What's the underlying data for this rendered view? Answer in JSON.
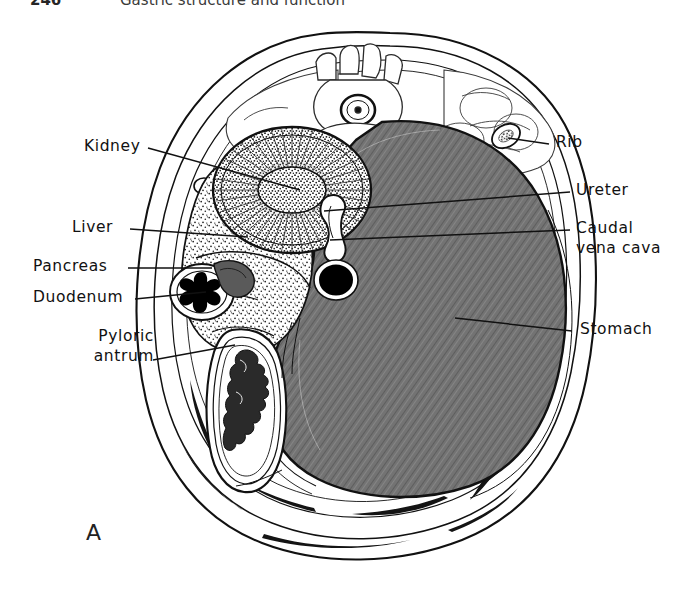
{
  "header": {
    "page_number": "246",
    "chapter_title": "Gastric structure and function"
  },
  "figure": {
    "panel_label": "A",
    "caption_type": "transverse abdominal cross-section"
  },
  "labels": {
    "left": [
      {
        "name": "kidney",
        "text": "Kidney",
        "text2": "",
        "x": 84,
        "y": 137,
        "lx": 148,
        "ly": 148,
        "tx": 300,
        "ty": 190
      },
      {
        "name": "liver",
        "text": "Liver",
        "text2": "",
        "x": 72,
        "y": 218,
        "lx": 130,
        "ly": 229,
        "tx": 248,
        "ty": 237
      },
      {
        "name": "pancreas",
        "text": "Pancreas",
        "text2": "",
        "x": 33,
        "y": 257,
        "lx": 128,
        "ly": 268,
        "tx": 212,
        "ty": 268
      },
      {
        "name": "duodenum",
        "text": "Duodenum",
        "text2": "",
        "x": 33,
        "y": 288,
        "lx": 135,
        "ly": 299,
        "tx": 206,
        "ty": 292
      },
      {
        "name": "pyloric-antrum",
        "text": "Pyloric",
        "text2": "antrum",
        "x": 68,
        "y": 327,
        "lx": 153,
        "ly": 360,
        "tx": 235,
        "ty": 345
      }
    ],
    "right": [
      {
        "name": "rib",
        "text": "Rib",
        "text2": "",
        "x": 556,
        "y": 133,
        "lx": 549,
        "ly": 144,
        "tx": 508,
        "ty": 138
      },
      {
        "name": "ureter",
        "text": "Ureter",
        "text2": "",
        "x": 576,
        "y": 181,
        "lx": 570,
        "ly": 192,
        "tx": 324,
        "ty": 211
      },
      {
        "name": "caudal-vena-cava",
        "text": "Caudal",
        "text2": "vena cava",
        "x": 576,
        "y": 219,
        "lx": 570,
        "ly": 230,
        "tx": 330,
        "ty": 240
      },
      {
        "name": "stomach",
        "text": "Stomach",
        "text2": "",
        "x": 580,
        "y": 320,
        "lx": 572,
        "ly": 331,
        "tx": 455,
        "ty": 318
      }
    ]
  },
  "colors": {
    "ink": "#111111",
    "stomach_fill": "#6f6f6f",
    "liver_fill": "#d8d8d8",
    "kidney_cortex": "#e2e2e2",
    "kidney_medulla": "#cfcfcf",
    "pancreas_fill": "#5a5a5a",
    "lumen_black": "#000000",
    "body_wall": "#ffffff",
    "background": "#ffffff"
  },
  "structures": [
    {
      "name": "body-wall",
      "label": "Body wall"
    },
    {
      "name": "vertebra",
      "label": "Vertebral body"
    },
    {
      "name": "spinal-cord",
      "label": "Spinal cord"
    },
    {
      "name": "epaxial-muscle",
      "label": "Epaxial musculature"
    },
    {
      "name": "aorta",
      "label": "Aorta"
    },
    {
      "name": "kidney",
      "label": "Kidney"
    },
    {
      "name": "liver",
      "label": "Liver"
    },
    {
      "name": "stomach",
      "label": "Stomach"
    },
    {
      "name": "duodenum",
      "label": "Duodenum"
    },
    {
      "name": "pancreas",
      "label": "Pancreas"
    },
    {
      "name": "pyloric-antrum",
      "label": "Pyloric antrum"
    },
    {
      "name": "ureter",
      "label": "Ureter"
    },
    {
      "name": "caudal-vena-cava",
      "label": "Caudal vena cava"
    },
    {
      "name": "rib",
      "label": "Rib"
    }
  ]
}
